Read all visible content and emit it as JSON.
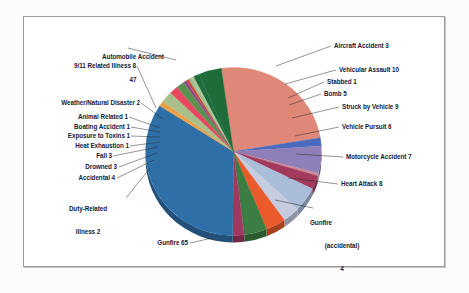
{
  "chart_data": {
    "type": "pie",
    "title": "",
    "subtitle": "",
    "xlabel": "",
    "ylabel": "",
    "legend_position": "none",
    "grid": false,
    "total": 171,
    "categories": [
      "Automobile Accident",
      "Aircraft Accident",
      "Vehicular Assault",
      "Stabbed",
      "Bomb",
      "Struck by Vehicle",
      "Vehicle Pursuit",
      "Motorcycle Accident",
      "Heart Attack",
      "Gunfire (accidental)",
      "Gunfire",
      "Duty-Related Illness",
      "Accidental",
      "Drowned",
      "Fall",
      "Heat Exhaustion",
      "Exposure to Toxins",
      "Boating Accident",
      "Animal Related",
      "Weather/Natural Disaster",
      "9/11 Related Illness"
    ],
    "values": [
      47,
      3,
      10,
      1,
      5,
      9,
      6,
      7,
      8,
      4,
      65,
      2,
      4,
      3,
      3,
      1,
      1,
      1,
      1,
      2,
      8
    ],
    "colors": [
      "#e08878",
      "#4a6bbd",
      "#8f7fb8",
      "#c98a92",
      "#a33a5e",
      "#a9bcd8",
      "#c5ccdf",
      "#eb5a2a",
      "#3b7d42",
      "#9e3a62",
      "#2f6fa8",
      "#e8a14a",
      "#a8c08a",
      "#e8485f",
      "#5d9150",
      "#8b4a8f",
      "#c94a3a",
      "#9fb88a",
      "#a9c99a",
      "#1f6b3a",
      "#1f6b3a"
    ],
    "slice_labels": [
      {
        "name": "automobile-accident",
        "text_line1": "Automobile Accident",
        "text_line2": "47"
      },
      {
        "name": "aircraft-accident",
        "text_line1": "Aircraft Accident 3"
      },
      {
        "name": "vehicular-assault",
        "text_line1": "Vehicular Assault 10"
      },
      {
        "name": "stabbed",
        "text_line1": "Stabbed 1"
      },
      {
        "name": "bomb",
        "text_line1": "Bomb 5"
      },
      {
        "name": "struck-by-vehicle",
        "text_line1": "Struck by Vehicle 9"
      },
      {
        "name": "vehicle-pursuit",
        "text_line1": "Vehicle Pursuit 6"
      },
      {
        "name": "motorcycle-accident",
        "text_line1": "Motorcycle Accident 7"
      },
      {
        "name": "heart-attack",
        "text_line1": "Heart Attack 8"
      },
      {
        "name": "gunfire-accidental",
        "text_line1": "Gunfire",
        "text_line2": "(accidental)",
        "text_line3": "4"
      },
      {
        "name": "gunfire",
        "text_line1": "Gunfire 65"
      },
      {
        "name": "duty-related-illness",
        "text_line1": "Duty-Related",
        "text_line2": "Illness 2"
      },
      {
        "name": "accidental",
        "text_line1": "Accidental 4"
      },
      {
        "name": "drowned",
        "text_line1": "Drowned 3"
      },
      {
        "name": "fall",
        "text_line1": "Fall 3"
      },
      {
        "name": "heat-exhaustion",
        "text_line1": "Heat Exhaustion 1"
      },
      {
        "name": "exposure-to-toxins",
        "text_line1": "Exposure to Toxins 1"
      },
      {
        "name": "boating-accident",
        "text_line1": "Boating Accident 1"
      },
      {
        "name": "animal-related",
        "text_line1": "Animal Related 1"
      },
      {
        "name": "weather-natural-disaster",
        "text_line1": "Weather/Natural Disaster 2"
      },
      {
        "name": "nine-eleven-related-illness",
        "text_line1": "9/11 Related Illness 8"
      }
    ]
  },
  "labels": {
    "automobile_accident_l1": "Automobile Accident",
    "automobile_accident_l2": "47",
    "nine_eleven": "9/11 Related Illness 8",
    "weather": "Weather/Natural Disaster 2",
    "animal_related": "Animal Related 1",
    "boating_accident": "Boating Accident 1",
    "exposure_toxins": "Exposure to Toxins 1",
    "heat_exhaustion": "Heat Exhaustion 1",
    "fall": "Fall 3",
    "drowned": "Drowned 3",
    "accidental": "Accidental 4",
    "duty_illness_l1": "Duty-Related",
    "duty_illness_l2": "Illness 2",
    "gunfire": "Gunfire 65",
    "aircraft_accident": "Aircraft Accident 3",
    "vehicular_assault": "Vehicular Assault 10",
    "stabbed": "Stabbed 1",
    "bomb": "Bomb 5",
    "struck_by_vehicle": "Struck by Vehicle 9",
    "vehicle_pursuit": "Vehicle Pursuit 6",
    "motorcycle_accident": "Motorcycle Accident 7",
    "heart_attack": "Heart Attack 8",
    "gunfire_acc_l1": "Gunfire",
    "gunfire_acc_l2": "(accidental)",
    "gunfire_acc_l3": "4"
  }
}
